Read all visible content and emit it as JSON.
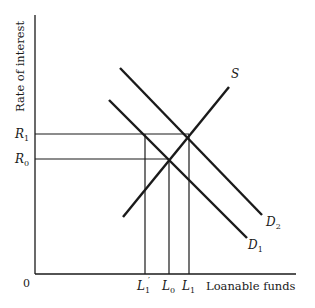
{
  "figure": {
    "y_axis_label": "Rate of interest",
    "x_axis_label": "Loanable funds",
    "origin_label": "0",
    "y_ticks": [
      {
        "label": "R",
        "sub": "1",
        "y": 134
      },
      {
        "label": "R",
        "sub": "0",
        "y": 159
      }
    ],
    "x_ticks": [
      {
        "label": "L",
        "sub": "1",
        "prime": "′",
        "x": 145
      },
      {
        "label": "L",
        "sub": "0",
        "x": 169
      },
      {
        "label": "L",
        "sub": "1",
        "x": 189
      }
    ],
    "curves": [
      {
        "name": "S",
        "label": "S",
        "x1": 123,
        "y1": 217,
        "x2": 229,
        "y2": 87
      },
      {
        "name": "D2",
        "label": "D",
        "sub": "2",
        "x1": 120,
        "y1": 68,
        "x2": 262,
        "y2": 215
      },
      {
        "name": "D1",
        "label": "D",
        "sub": "1",
        "x1": 109,
        "y1": 100,
        "x2": 247,
        "y2": 238
      }
    ],
    "line_color": "#1a1a1a"
  }
}
